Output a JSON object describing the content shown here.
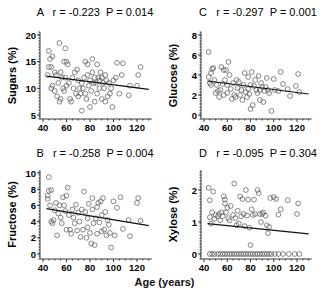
{
  "x_axis_label": "Age (years)",
  "chart_data": [
    {
      "type": "scatter",
      "panel": "A",
      "title": "A   r = -0.223  P = 0.014",
      "label": "A",
      "r": "r = -0.223",
      "p": "P = 0.014",
      "xlabel": "Age (years)",
      "ylabel": "Sugars (%)",
      "xlim": [
        38,
        130
      ],
      "ylim": [
        5,
        20
      ],
      "xticks": [
        40,
        60,
        80,
        100,
        120
      ],
      "yticks": [
        5,
        10,
        15,
        20
      ],
      "fit_line": {
        "x": [
          43,
          130
        ],
        "y": [
          12.3,
          9.8
        ]
      },
      "points": [
        [
          44,
          12.5
        ],
        [
          45,
          17
        ],
        [
          45,
          14
        ],
        [
          46,
          15.5
        ],
        [
          47,
          14
        ],
        [
          47,
          10
        ],
        [
          48,
          10.5
        ],
        [
          48,
          16
        ],
        [
          50,
          13
        ],
        [
          50,
          9.5
        ],
        [
          51,
          12.5
        ],
        [
          52,
          8.5
        ],
        [
          53,
          11
        ],
        [
          54,
          7.5
        ],
        [
          54,
          18.5
        ],
        [
          55,
          13
        ],
        [
          55,
          8
        ],
        [
          56,
          12
        ],
        [
          57,
          10
        ],
        [
          58,
          15
        ],
        [
          58,
          9.5
        ],
        [
          59,
          17.5
        ],
        [
          59,
          12
        ],
        [
          60,
          15
        ],
        [
          60,
          10.5
        ],
        [
          61,
          14.5
        ],
        [
          62,
          11
        ],
        [
          63,
          8
        ],
        [
          64,
          7.5
        ],
        [
          65,
          12
        ],
        [
          66,
          10
        ],
        [
          67,
          13
        ],
        [
          68,
          9
        ],
        [
          69,
          13.5
        ],
        [
          70,
          11.5
        ],
        [
          70,
          8.5
        ],
        [
          71,
          10
        ],
        [
          72,
          9
        ],
        [
          73,
          5.8
        ],
        [
          73,
          11
        ],
        [
          74,
          10
        ],
        [
          75,
          12
        ],
        [
          76,
          15
        ],
        [
          76,
          9
        ],
        [
          77,
          8
        ],
        [
          78,
          12.5
        ],
        [
          78,
          14.5
        ],
        [
          79,
          10.5
        ],
        [
          80,
          11.5
        ],
        [
          80,
          6.5
        ],
        [
          81,
          9.5
        ],
        [
          82,
          15.5
        ],
        [
          82,
          13
        ],
        [
          83,
          11
        ],
        [
          84,
          12
        ],
        [
          84,
          7.5
        ],
        [
          85,
          11
        ],
        [
          86,
          14.5
        ],
        [
          86,
          9
        ],
        [
          87,
          12
        ],
        [
          88,
          11.5
        ],
        [
          88,
          10
        ],
        [
          89,
          13
        ],
        [
          90,
          12
        ],
        [
          90,
          8
        ],
        [
          91,
          11
        ],
        [
          92,
          10
        ],
        [
          93,
          12.5
        ],
        [
          93,
          7.5
        ],
        [
          94,
          11.5
        ],
        [
          95,
          8.5
        ],
        [
          96,
          11
        ],
        [
          97,
          9
        ],
        [
          98,
          10
        ],
        [
          99,
          6.5
        ],
        [
          100,
          11.5
        ],
        [
          102,
          12
        ],
        [
          103,
          14.8
        ],
        [
          105,
          9
        ],
        [
          107,
          12.5
        ],
        [
          108,
          14.7
        ],
        [
          113,
          8.7
        ],
        [
          114,
          10.5
        ],
        [
          120,
          10.5
        ],
        [
          121,
          12.5
        ],
        [
          123,
          14
        ]
      ]
    },
    {
      "type": "scatter",
      "panel": "C",
      "title": "C   r = -0.297  P = 0.001",
      "label": "C",
      "r": "r = -0.297",
      "p": "P = 0.001",
      "xlabel": "Age (years)",
      "ylabel": "Glucose (%)",
      "xlim": [
        38,
        130
      ],
      "ylim": [
        0,
        8
      ],
      "xticks": [
        40,
        60,
        80,
        100,
        120
      ],
      "yticks": [
        0,
        2,
        4,
        6,
        8
      ],
      "fit_line": {
        "x": [
          43,
          130
        ],
        "y": [
          3.4,
          2.1
        ]
      },
      "points": [
        [
          44,
          6.3
        ],
        [
          44,
          3.8
        ],
        [
          45,
          3.2
        ],
        [
          46,
          4.2
        ],
        [
          46,
          3
        ],
        [
          47,
          4.6
        ],
        [
          48,
          4.7
        ],
        [
          49,
          3.5
        ],
        [
          50,
          2.2
        ],
        [
          51,
          3
        ],
        [
          52,
          2.4
        ],
        [
          53,
          1.8
        ],
        [
          54,
          2.5
        ],
        [
          55,
          4.8
        ],
        [
          56,
          3.1
        ],
        [
          57,
          4.5
        ],
        [
          57,
          2
        ],
        [
          58,
          3.5
        ],
        [
          59,
          4.5
        ],
        [
          60,
          3
        ],
        [
          60,
          2.2
        ],
        [
          61,
          5.3
        ],
        [
          62,
          4
        ],
        [
          63,
          2.6
        ],
        [
          64,
          1.6
        ],
        [
          65,
          3.2
        ],
        [
          66,
          2
        ],
        [
          67,
          1.8
        ],
        [
          68,
          3.5
        ],
        [
          69,
          2.7
        ],
        [
          70,
          3.3
        ],
        [
          71,
          2
        ],
        [
          72,
          2.5
        ],
        [
          73,
          1.5
        ],
        [
          74,
          3
        ],
        [
          75,
          4.2
        ],
        [
          76,
          2.3
        ],
        [
          77,
          1.8
        ],
        [
          78,
          3.8
        ],
        [
          78,
          2.6
        ],
        [
          79,
          2.1
        ],
        [
          80,
          3
        ],
        [
          80,
          0.6
        ],
        [
          81,
          4.3
        ],
        [
          82,
          1
        ],
        [
          83,
          2.9
        ],
        [
          84,
          3.5
        ],
        [
          85,
          2.5
        ],
        [
          86,
          2.2
        ],
        [
          87,
          3.9
        ],
        [
          88,
          2.5
        ],
        [
          88,
          1.5
        ],
        [
          89,
          3.2
        ],
        [
          90,
          2.8
        ],
        [
          91,
          1.3
        ],
        [
          92,
          2.4
        ],
        [
          93,
          2.8
        ],
        [
          94,
          3.7
        ],
        [
          95,
          2.5
        ],
        [
          96,
          2.2
        ],
        [
          98,
          0.4
        ],
        [
          100,
          3.6
        ],
        [
          101,
          2.5
        ],
        [
          104,
          2.4
        ],
        [
          106,
          4.3
        ],
        [
          108,
          3.1
        ],
        [
          112,
          2.6
        ],
        [
          114,
          1.9
        ],
        [
          119,
          2.9
        ],
        [
          121,
          4.1
        ],
        [
          122,
          2.3
        ]
      ]
    },
    {
      "type": "scatter",
      "panel": "B",
      "title": "B   r = -0.258  P = 0.004",
      "label": "B",
      "r": "r = -0.258",
      "p": "P = 0.004",
      "xlabel": "Age (years)",
      "ylabel": "Fructose (%)",
      "xlim": [
        38,
        130
      ],
      "ylim": [
        0,
        10
      ],
      "xticks": [
        40,
        60,
        80,
        100,
        120
      ],
      "yticks": [
        0,
        2,
        4,
        6,
        8,
        10
      ],
      "fit_line": {
        "x": [
          43,
          130
        ],
        "y": [
          5.6,
          3.5
        ]
      },
      "points": [
        [
          44,
          7.2
        ],
        [
          44,
          6.8
        ],
        [
          45,
          9.5
        ],
        [
          45,
          7.8
        ],
        [
          46,
          6
        ],
        [
          47,
          4
        ],
        [
          47,
          7.9
        ],
        [
          48,
          3.8
        ],
        [
          49,
          4.2
        ],
        [
          50,
          5.4
        ],
        [
          51,
          6.3
        ],
        [
          52,
          2.3
        ],
        [
          53,
          5
        ],
        [
          54,
          6
        ],
        [
          55,
          4.5
        ],
        [
          56,
          3.8
        ],
        [
          57,
          7
        ],
        [
          58,
          6
        ],
        [
          59,
          5.3
        ],
        [
          60,
          7.2
        ],
        [
          60,
          3
        ],
        [
          61,
          8.2
        ],
        [
          62,
          4.8
        ],
        [
          63,
          3
        ],
        [
          64,
          2.5
        ],
        [
          65,
          5.5
        ],
        [
          66,
          4.5
        ],
        [
          67,
          3.8
        ],
        [
          68,
          6.1
        ],
        [
          69,
          2.9
        ],
        [
          70,
          5.1
        ],
        [
          71,
          4
        ],
        [
          72,
          2.1
        ],
        [
          73,
          5.5
        ],
        [
          74,
          3
        ],
        [
          75,
          7.7
        ],
        [
          76,
          5.2
        ],
        [
          77,
          2
        ],
        [
          78,
          4.4
        ],
        [
          78,
          3.3
        ],
        [
          79,
          6.2
        ],
        [
          80,
          2.6
        ],
        [
          81,
          1.3
        ],
        [
          82,
          5.5
        ],
        [
          82,
          6.9
        ],
        [
          83,
          3.8
        ],
        [
          84,
          1.1
        ],
        [
          85,
          4.4
        ],
        [
          86,
          2.5
        ],
        [
          86,
          5.8
        ],
        [
          87,
          6.3
        ],
        [
          88,
          3.9
        ],
        [
          89,
          6.5
        ],
        [
          90,
          2.8
        ],
        [
          90,
          4.8
        ],
        [
          91,
          6.9
        ],
        [
          92,
          3
        ],
        [
          93,
          5.2
        ],
        [
          94,
          2.3
        ],
        [
          95,
          4.2
        ],
        [
          96,
          3.6
        ],
        [
          97,
          2.6
        ],
        [
          98,
          0.8
        ],
        [
          100,
          6.5
        ],
        [
          101,
          2.3
        ],
        [
          103,
          5.7
        ],
        [
          106,
          7
        ],
        [
          108,
          3.1
        ],
        [
          113,
          4.2
        ],
        [
          114,
          2.2
        ],
        [
          120,
          6.3
        ],
        [
          121,
          6.9
        ],
        [
          123,
          4.1
        ]
      ]
    },
    {
      "type": "scatter",
      "panel": "D",
      "title": "D   r = -0.095  P = 0.304",
      "label": "D",
      "r": "r = -0.095",
      "p": "P = 0.304",
      "xlabel": "Age (years)",
      "ylabel": "Xylose (%)",
      "xlim": [
        38,
        130
      ],
      "ylim": [
        0,
        2.5
      ],
      "xticks": [
        40,
        60,
        80,
        100,
        120
      ],
      "yticks": [
        0,
        1,
        2
      ],
      "fit_line": {
        "x": [
          43,
          130
        ],
        "y": [
          0.95,
          0.63
        ]
      },
      "points": [
        [
          44,
          2.07
        ],
        [
          45,
          1.68
        ],
        [
          45,
          1.15
        ],
        [
          46,
          0.95
        ],
        [
          47,
          1.3
        ],
        [
          48,
          1.95
        ],
        [
          49,
          1.1
        ],
        [
          50,
          1.22
        ],
        [
          52,
          1.18
        ],
        [
          53,
          1.25
        ],
        [
          54,
          1.05
        ],
        [
          55,
          1.3
        ],
        [
          56,
          1.18
        ],
        [
          57,
          1.8
        ],
        [
          58,
          1.7
        ],
        [
          58,
          1.58
        ],
        [
          59,
          1.3
        ],
        [
          60,
          1.45
        ],
        [
          61,
          1.12
        ],
        [
          62,
          1.05
        ],
        [
          63,
          1.5
        ],
        [
          65,
          1.22
        ],
        [
          66,
          2.2
        ],
        [
          67,
          1.12
        ],
        [
          68,
          0.9
        ],
        [
          69,
          1.35
        ],
        [
          70,
          0.95
        ],
        [
          71,
          1.8
        ],
        [
          72,
          1.18
        ],
        [
          73,
          1.72
        ],
        [
          74,
          1.25
        ],
        [
          75,
          0.87
        ],
        [
          76,
          2.0
        ],
        [
          77,
          1.2
        ],
        [
          78,
          1.7
        ],
        [
          79,
          0.82
        ],
        [
          80,
          0.28
        ],
        [
          81,
          1.4
        ],
        [
          82,
          1.22
        ],
        [
          83,
          1.7
        ],
        [
          84,
          1.25
        ],
        [
          86,
          2.0
        ],
        [
          87,
          1.9
        ],
        [
          88,
          1.25
        ],
        [
          89,
          1.0
        ],
        [
          90,
          1.25
        ],
        [
          91,
          1.3
        ],
        [
          93,
          1.2
        ],
        [
          94,
          0.9
        ],
        [
          95,
          0.65
        ],
        [
          96,
          0.85
        ],
        [
          97,
          1.75
        ],
        [
          100,
          1.78
        ],
        [
          102,
          1.72
        ],
        [
          104,
          1.23
        ],
        [
          106,
          1.4
        ],
        [
          112,
          1.68
        ],
        [
          120,
          1.25
        ],
        [
          121,
          1.58
        ],
        [
          45,
          0
        ],
        [
          47,
          0
        ],
        [
          49,
          0
        ],
        [
          52,
          0
        ],
        [
          54,
          0
        ],
        [
          56,
          0
        ],
        [
          58,
          0
        ],
        [
          60,
          0
        ],
        [
          62,
          0
        ],
        [
          64,
          0
        ],
        [
          66,
          0
        ],
        [
          68,
          0
        ],
        [
          70,
          0
        ],
        [
          72,
          0
        ],
        [
          74,
          0
        ],
        [
          76,
          0
        ],
        [
          78,
          0
        ],
        [
          80,
          0
        ],
        [
          82,
          0
        ],
        [
          84,
          0
        ],
        [
          86,
          0
        ],
        [
          88,
          0
        ],
        [
          90,
          0
        ],
        [
          92,
          0
        ],
        [
          94,
          0
        ],
        [
          96,
          0
        ],
        [
          98,
          0
        ],
        [
          101,
          0
        ],
        [
          104,
          0
        ],
        [
          108,
          0
        ],
        [
          113,
          0
        ],
        [
          118,
          0
        ],
        [
          122,
          0
        ]
      ]
    }
  ]
}
